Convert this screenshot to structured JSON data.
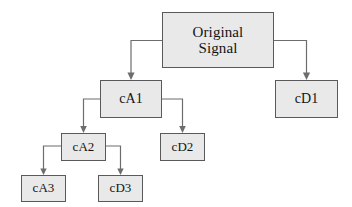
{
  "diagram": {
    "type": "tree-diagram",
    "colors": {
      "node_fill": "#e9e9e9",
      "node_border": "#5a5a5a",
      "edge": "#6d6d6d",
      "text": "#141414",
      "background": "#ffffff"
    },
    "nodes": [
      {
        "id": "root",
        "label": "Original\nSignal",
        "level": 0
      },
      {
        "id": "ca1",
        "label": "cA1",
        "level": 1
      },
      {
        "id": "cd1",
        "label": "cD1",
        "level": 1
      },
      {
        "id": "ca2",
        "label": "cA2",
        "level": 2
      },
      {
        "id": "cd2",
        "label": "cD2",
        "level": 2
      },
      {
        "id": "ca3",
        "label": "cA3",
        "level": 3
      },
      {
        "id": "cd3",
        "label": "cD3",
        "level": 3
      }
    ],
    "edges": [
      {
        "from": "root",
        "to": "ca1",
        "side": "left"
      },
      {
        "from": "root",
        "to": "cd1",
        "side": "right"
      },
      {
        "from": "ca1",
        "to": "ca2",
        "side": "left"
      },
      {
        "from": "ca1",
        "to": "cd2",
        "side": "right"
      },
      {
        "from": "ca2",
        "to": "ca3",
        "side": "left"
      },
      {
        "from": "ca2",
        "to": "cd3",
        "side": "right"
      }
    ]
  }
}
